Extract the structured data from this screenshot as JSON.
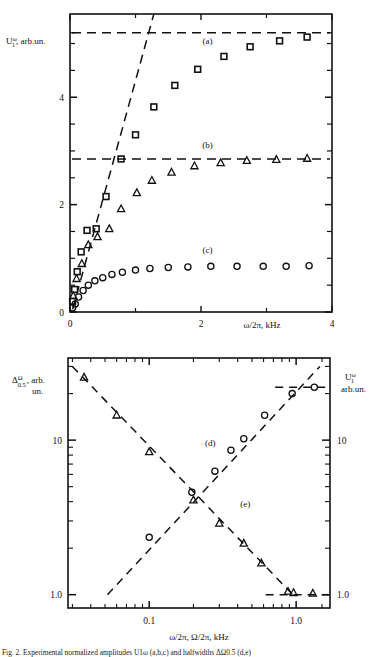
{
  "figure": {
    "caption": "Fig. 2.    Experimental normalized amplitudes U1ω (a,b,c) and halfwidths ΔΩ0.5 (d,e)"
  },
  "chart_data": [
    {
      "type": "scatter",
      "id": "top-panel",
      "title": "",
      "xlabel": "ω/2π, kHz",
      "ylabel": "U₁ᵠ, arb.un.",
      "ylabel_parts": {
        "base": "U",
        "sub": "1",
        "sup": "ω",
        "rest": ", arb.un."
      },
      "xlim": [
        0,
        4
      ],
      "ylim": [
        0,
        5.55
      ],
      "xticks": [
        0,
        2,
        4
      ],
      "xtick_labels": [
        "0",
        "2",
        "4"
      ],
      "xminor": [
        1,
        3
      ],
      "yticks": [
        0,
        2,
        4
      ],
      "ytick_labels": [
        "0",
        "2",
        "4"
      ],
      "yminor": [
        0.5,
        1,
        1.5,
        2.5,
        3,
        3.5,
        4.5,
        5,
        5.2
      ],
      "grid": false,
      "legend": "none",
      "annotations": [
        {
          "label": "(a)",
          "x": 2.1,
          "y": 5.0
        },
        {
          "label": "(b)",
          "x": 2.1,
          "y": 3.05
        },
        {
          "label": "(c)",
          "x": 2.1,
          "y": 1.1
        }
      ],
      "asymptotes": [
        {
          "name": "asymptote-a",
          "y": 5.2,
          "style": "dashed"
        },
        {
          "name": "asymptote-b",
          "y": 2.85,
          "style": "dashed"
        }
      ],
      "slope_line": {
        "name": "initial-slope",
        "x0": 0.04,
        "y0": 0.05,
        "x1": 1.28,
        "y1": 5.55,
        "style": "dashed"
      },
      "series": [
        {
          "name": "(a)",
          "marker": "square",
          "points": [
            [
              0.04,
              0.2
            ],
            [
              0.07,
              0.42
            ],
            [
              0.11,
              0.75
            ],
            [
              0.17,
              1.12
            ],
            [
              0.26,
              1.52
            ],
            [
              0.4,
              1.55
            ],
            [
              0.55,
              2.15
            ],
            [
              0.78,
              2.85
            ],
            [
              1.0,
              3.3
            ],
            [
              1.28,
              3.82
            ],
            [
              1.6,
              4.22
            ],
            [
              1.95,
              4.52
            ],
            [
              2.35,
              4.76
            ],
            [
              2.75,
              4.94
            ],
            [
              3.2,
              5.05
            ],
            [
              3.62,
              5.12
            ]
          ]
        },
        {
          "name": "(b)",
          "marker": "triangle",
          "points": [
            [
              0.05,
              0.3
            ],
            [
              0.1,
              0.62
            ],
            [
              0.18,
              0.9
            ],
            [
              0.28,
              1.25
            ],
            [
              0.42,
              1.4
            ],
            [
              0.6,
              1.55
            ],
            [
              0.78,
              1.92
            ],
            [
              1.02,
              2.22
            ],
            [
              1.25,
              2.45
            ],
            [
              1.55,
              2.6
            ],
            [
              1.9,
              2.72
            ],
            [
              2.3,
              2.78
            ],
            [
              2.7,
              2.82
            ],
            [
              3.15,
              2.84
            ],
            [
              3.62,
              2.86
            ]
          ]
        },
        {
          "name": "(c)",
          "marker": "circle",
          "points": [
            [
              0.04,
              0.08
            ],
            [
              0.08,
              0.15
            ],
            [
              0.13,
              0.28
            ],
            [
              0.2,
              0.4
            ],
            [
              0.28,
              0.5
            ],
            [
              0.38,
              0.58
            ],
            [
              0.5,
              0.64
            ],
            [
              0.64,
              0.7
            ],
            [
              0.8,
              0.74
            ],
            [
              1.0,
              0.78
            ],
            [
              1.22,
              0.81
            ],
            [
              1.5,
              0.83
            ],
            [
              1.8,
              0.84
            ],
            [
              2.15,
              0.85
            ],
            [
              2.55,
              0.85
            ],
            [
              2.95,
              0.85
            ],
            [
              3.3,
              0.85
            ],
            [
              3.65,
              0.86
            ]
          ]
        }
      ]
    },
    {
      "type": "scatter",
      "id": "bottom-panel",
      "title": "",
      "xlabel": "ω/2π, Ω/2π, kHz",
      "ylabel_left": "ΔΩ₀.₅, arb. un.",
      "ylabel_left_parts": {
        "base": "Δ",
        "sub": "0.5",
        "sup": "Ω",
        "rest": ", arb.",
        "rest2": "un."
      },
      "ylabel_right": "U₁ᵠ, arb.un.",
      "ylabel_right_parts": {
        "base": "U",
        "sub": "1",
        "sup": "ω",
        "rest": "arb.un."
      },
      "xscale": "log",
      "yscale": "log",
      "xlim": [
        0.028,
        1.7
      ],
      "ylim": [
        0.82,
        34
      ],
      "xticks": [
        0.1,
        1.0
      ],
      "xtick_labels": [
        "0.1",
        "1.0"
      ],
      "yticks": [
        1.0,
        10
      ],
      "ytick_labels": [
        "1.0",
        "10"
      ],
      "ytick_labels_right": [
        "1.0",
        "10"
      ],
      "grid": false,
      "annotations": [
        {
          "label": "(d)",
          "x": 0.26,
          "y": 9.2
        },
        {
          "label": "(e)",
          "x": 0.45,
          "y": 3.7
        }
      ],
      "asymptotes": [
        {
          "name": "asymptote-d",
          "y": 22.0,
          "x0": 0.72,
          "x1": 1.7,
          "style": "dashed"
        },
        {
          "name": "asymptote-e",
          "y": 1.0,
          "x0": 0.62,
          "x1": 1.7,
          "style": "dashed"
        }
      ],
      "trend_lines": [
        {
          "name": "trend-d",
          "x0": 0.052,
          "y0": 1.0,
          "x1": 1.45,
          "y1": 30.0,
          "style": "dashed"
        },
        {
          "name": "trend-e",
          "x0": 0.03,
          "y0": 30.0,
          "x1": 1.0,
          "y1": 0.95,
          "style": "dashed"
        }
      ],
      "series": [
        {
          "name": "(d)",
          "marker": "circle",
          "points": [
            [
              0.1,
              2.35
            ],
            [
              0.195,
              4.6
            ],
            [
              0.28,
              6.3
            ],
            [
              0.36,
              8.6
            ],
            [
              0.44,
              10.2
            ],
            [
              0.61,
              14.5
            ],
            [
              0.94,
              20.0
            ],
            [
              1.33,
              22.0
            ]
          ]
        },
        {
          "name": "(e)",
          "marker": "triangle",
          "points": [
            [
              0.036,
              25.5
            ],
            [
              0.06,
              14.5
            ],
            [
              0.1,
              8.4
            ],
            [
              0.2,
              4.1
            ],
            [
              0.3,
              2.9
            ],
            [
              0.44,
              2.15
            ],
            [
              0.58,
              1.6
            ],
            [
              0.88,
              1.05
            ],
            [
              0.96,
              1.03
            ],
            [
              1.3,
              1.02
            ]
          ]
        }
      ]
    }
  ]
}
